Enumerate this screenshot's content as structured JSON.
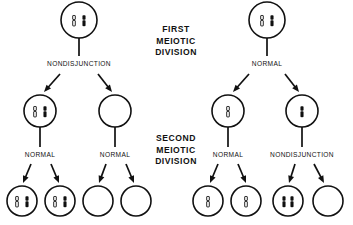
{
  "diagram": {
    "colors": {
      "ink": "#111111",
      "background": "#ffffff",
      "chromosome_dark": "#111111",
      "chromosome_light": "#ffffff"
    },
    "stage_labels": [
      {
        "id": "first-division",
        "lines": [
          "FIRST",
          "MEIOTIC",
          "DIVISION"
        ],
        "x": 176,
        "y": 30
      },
      {
        "id": "second-division",
        "lines": [
          "SECOND",
          "MEIOTIC",
          "DIVISION"
        ],
        "x": 176,
        "y": 139
      }
    ],
    "branch_labels": [
      {
        "id": "left-first-division-label",
        "text": "NONDISJUNCTION",
        "x": 79,
        "y": 64
      },
      {
        "id": "right-first-division-label",
        "text": "NORMAL",
        "x": 267,
        "y": 64
      },
      {
        "id": "left-inner-second-division-label",
        "text": "NORMAL",
        "x": 40,
        "y": 155
      },
      {
        "id": "left-outer-second-division-label",
        "text": "NORMAL",
        "x": 115,
        "y": 155
      },
      {
        "id": "right-inner-second-division-label",
        "text": "NORMAL",
        "x": 228,
        "y": 155
      },
      {
        "id": "right-outer-second-division-label",
        "text": "NONDISJUNCTION",
        "x": 302,
        "y": 155
      }
    ],
    "cells": [
      {
        "id": "left-parent-cell",
        "row": "parent",
        "cx": 79,
        "cy": 20,
        "r": 18,
        "chromosomes": [
          {
            "type": "light",
            "offset": -5
          },
          {
            "type": "dark",
            "offset": 5
          }
        ]
      },
      {
        "id": "right-parent-cell",
        "row": "parent",
        "cx": 267,
        "cy": 20,
        "r": 18,
        "chromosomes": [
          {
            "type": "light",
            "offset": -5
          },
          {
            "type": "dark",
            "offset": 5
          }
        ]
      },
      {
        "id": "left-secondary-cell-disomic",
        "row": "secondary",
        "cx": 40,
        "cy": 111,
        "r": 16,
        "chromosomes": [
          {
            "type": "light",
            "offset": -5
          },
          {
            "type": "dark",
            "offset": 5
          }
        ]
      },
      {
        "id": "left-secondary-cell-nullisomic",
        "row": "secondary",
        "cx": 115,
        "cy": 111,
        "r": 16,
        "chromosomes": []
      },
      {
        "id": "right-secondary-cell-light",
        "row": "secondary",
        "cx": 228,
        "cy": 111,
        "r": 16,
        "chromosomes": [
          {
            "type": "light",
            "offset": 0
          }
        ]
      },
      {
        "id": "right-secondary-cell-dark",
        "row": "secondary",
        "cx": 302,
        "cy": 111,
        "r": 16,
        "chromosomes": [
          {
            "type": "dark",
            "offset": 0
          }
        ]
      },
      {
        "id": "gamete-1",
        "row": "gamete",
        "cx": 22,
        "cy": 201,
        "r": 15,
        "chromosomes": [
          {
            "type": "light",
            "offset": -5
          },
          {
            "type": "dark",
            "offset": 5
          }
        ]
      },
      {
        "id": "gamete-2",
        "row": "gamete",
        "cx": 60,
        "cy": 201,
        "r": 15,
        "chromosomes": [
          {
            "type": "light",
            "offset": -5
          },
          {
            "type": "dark",
            "offset": 5
          }
        ]
      },
      {
        "id": "gamete-3",
        "row": "gamete",
        "cx": 98,
        "cy": 201,
        "r": 15,
        "chromosomes": []
      },
      {
        "id": "gamete-4",
        "row": "gamete",
        "cx": 136,
        "cy": 201,
        "r": 15,
        "chromosomes": []
      },
      {
        "id": "gamete-5",
        "row": "gamete",
        "cx": 208,
        "cy": 201,
        "r": 15,
        "chromosomes": [
          {
            "type": "light",
            "offset": 0
          }
        ]
      },
      {
        "id": "gamete-6",
        "row": "gamete",
        "cx": 246,
        "cy": 201,
        "r": 15,
        "chromosomes": [
          {
            "type": "light",
            "offset": 0
          }
        ]
      },
      {
        "id": "gamete-7",
        "row": "gamete",
        "cx": 288,
        "cy": 201,
        "r": 15,
        "chromosomes": [
          {
            "type": "dark",
            "offset": -4
          },
          {
            "type": "dark",
            "offset": 4
          }
        ]
      },
      {
        "id": "gamete-8",
        "row": "gamete",
        "cx": 328,
        "cy": 201,
        "r": 15,
        "chromosomes": []
      }
    ],
    "stems": [
      {
        "id": "left-parent-stem",
        "x1": 79,
        "y1": 38,
        "x2": 79,
        "y2": 56
      },
      {
        "id": "right-parent-stem",
        "x1": 267,
        "y1": 38,
        "x2": 267,
        "y2": 56
      },
      {
        "id": "left-inner-secondary-stem",
        "x1": 40,
        "y1": 127,
        "x2": 40,
        "y2": 147
      },
      {
        "id": "left-outer-secondary-stem",
        "x1": 115,
        "y1": 127,
        "x2": 115,
        "y2": 147
      },
      {
        "id": "right-inner-secondary-stem",
        "x1": 228,
        "y1": 127,
        "x2": 228,
        "y2": 147
      },
      {
        "id": "right-outer-secondary-stem",
        "x1": 302,
        "y1": 127,
        "x2": 302,
        "y2": 147
      }
    ],
    "arrows": [
      {
        "id": "arrow-left-first-to-disomic",
        "x1": 60,
        "y1": 74,
        "x2": 44,
        "y2": 92
      },
      {
        "id": "arrow-left-first-to-nullisomic",
        "x1": 98,
        "y1": 74,
        "x2": 112,
        "y2": 92
      },
      {
        "id": "arrow-right-first-to-light",
        "x1": 249,
        "y1": 74,
        "x2": 233,
        "y2": 92
      },
      {
        "id": "arrow-right-first-to-dark",
        "x1": 285,
        "y1": 74,
        "x2": 299,
        "y2": 92
      },
      {
        "id": "arrow-gamete-1",
        "x1": 31,
        "y1": 164,
        "x2": 23,
        "y2": 183
      },
      {
        "id": "arrow-gamete-2",
        "x1": 51,
        "y1": 164,
        "x2": 59,
        "y2": 183
      },
      {
        "id": "arrow-gamete-3",
        "x1": 106,
        "y1": 164,
        "x2": 99,
        "y2": 183
      },
      {
        "id": "arrow-gamete-4",
        "x1": 126,
        "y1": 164,
        "x2": 134,
        "y2": 183
      },
      {
        "id": "arrow-gamete-5",
        "x1": 218,
        "y1": 164,
        "x2": 210,
        "y2": 183
      },
      {
        "id": "arrow-gamete-6",
        "x1": 238,
        "y1": 164,
        "x2": 246,
        "y2": 183
      },
      {
        "id": "arrow-gamete-7",
        "x1": 295,
        "y1": 164,
        "x2": 289,
        "y2": 183
      },
      {
        "id": "arrow-gamete-8",
        "x1": 314,
        "y1": 164,
        "x2": 324,
        "y2": 183
      }
    ]
  }
}
